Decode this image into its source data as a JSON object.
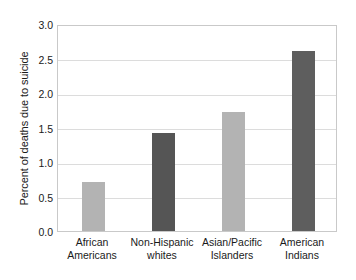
{
  "chart_data": {
    "type": "bar",
    "title": "",
    "subtitle": "",
    "xlabel": "",
    "ylabel": "Percent of deaths due to suicide",
    "ylim": [
      0.0,
      3.0
    ],
    "yticks": [
      "0.0",
      "0.5",
      "1.0",
      "1.5",
      "2.0",
      "2.5",
      "3.0"
    ],
    "ytick_values": [
      0.0,
      0.5,
      1.0,
      1.5,
      2.0,
      2.5,
      3.0
    ],
    "grid": "horizontal",
    "legend": "none",
    "categories": [
      "African Americans",
      "Non-Hispanic whites",
      "Asian/Pacific Islanders",
      "American Indians"
    ],
    "category_lines": [
      [
        "African",
        "Americans"
      ],
      [
        "Non-Hispanic",
        "whites"
      ],
      [
        "Asian/Pacific",
        "Islanders"
      ],
      [
        "American",
        "Indians"
      ]
    ],
    "values": [
      0.71,
      1.42,
      1.72,
      2.61
    ],
    "bar_colors": [
      "#b3b3b3",
      "#555555",
      "#b3b3b3",
      "#5e5e5e"
    ]
  },
  "style": {
    "background": "#ffffff",
    "frame_color": "#c9c9c9",
    "gridline_color": "#dcdcdc",
    "text_color": "#1a1a1a"
  }
}
